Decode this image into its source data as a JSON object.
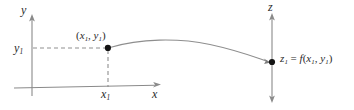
{
  "figure": {
    "caption_type": "function-mapping-diagram",
    "background_color": "#ffffff",
    "axis_color": "#8a8a8a",
    "curve_color": "#8e8e8e",
    "point_color": "#131313",
    "dashed_color": "#8f8f8f",
    "label_color": "#2b2b2b"
  },
  "labels": {
    "y_axis": "y",
    "x_axis": "x",
    "z_axis": "z",
    "y_tick": {
      "base": "y",
      "sub": "1"
    },
    "x_tick": {
      "base": "x",
      "sub": "1"
    },
    "point": {
      "open_paren": "(",
      "x_base": "x",
      "x_sub": "1",
      "separator": ", ",
      "y_base": "y",
      "y_sub": "1",
      "close_paren": ")"
    },
    "z_value": {
      "z_base": "z",
      "z_sub": "1",
      "equals": " = ",
      "f": "f",
      "open_paren": "(",
      "x_base": "x",
      "x_sub": "1",
      "separator": ", ",
      "y_base": "y",
      "y_sub": "1",
      "close_paren": ")"
    }
  },
  "geometry": {
    "y_axis_x": 32,
    "y_axis_top": 16,
    "y_axis_bottom": 96,
    "x_axis_y": 88,
    "x_axis_left": 14,
    "x_axis_right": 160,
    "z_axis_x": 272,
    "z_axis_top": 16,
    "z_axis_bottom": 100,
    "point_x": 108,
    "point_y": 48,
    "z_point_x": 272,
    "z_point_y": 62,
    "curve_peak_x": 196,
    "curve_peak_y": 41
  }
}
